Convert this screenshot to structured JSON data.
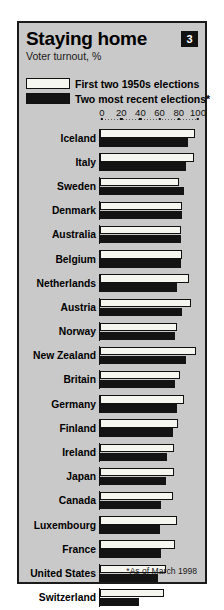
{
  "header": {
    "title": "Staying home",
    "subtitle": "Voter turnout, %",
    "badge": "3"
  },
  "legend": {
    "items": [
      {
        "label": "First two 1950s elections",
        "swatch": "white"
      },
      {
        "label": "Two most recent elections*",
        "swatch": "black"
      }
    ]
  },
  "footnote": "*As of March 1998",
  "chart_data": {
    "type": "bar",
    "orientation": "horizontal",
    "title": "Staying home",
    "subtitle": "Voter turnout, %",
    "xlabel": "",
    "ylabel": "",
    "xlim": [
      0,
      100
    ],
    "ticks": [
      0,
      20,
      40,
      60,
      80,
      100
    ],
    "grid": false,
    "legend_position": "top",
    "categories": [
      "Iceland",
      "Italy",
      "Sweden",
      "Denmark",
      "Australia",
      "Belgium",
      "Netherlands",
      "Austria",
      "Norway",
      "New Zealand",
      "Britain",
      "Germany",
      "Finland",
      "Ireland",
      "Japan",
      "Canada",
      "Luxembourg",
      "France",
      "United States",
      "Switzerland"
    ],
    "series": [
      {
        "name": "First two 1950s elections",
        "values": [
          97,
          96,
          81,
          84,
          83,
          84,
          91,
          93,
          79,
          98,
          82,
          86,
          80,
          75,
          76,
          74,
          79,
          77,
          67,
          65
        ]
      },
      {
        "name": "Two most recent elections*",
        "values": [
          90,
          88,
          86,
          84,
          83,
          83,
          79,
          84,
          77,
          88,
          77,
          79,
          74,
          68,
          67,
          62,
          61,
          62,
          59,
          40
        ]
      }
    ]
  }
}
